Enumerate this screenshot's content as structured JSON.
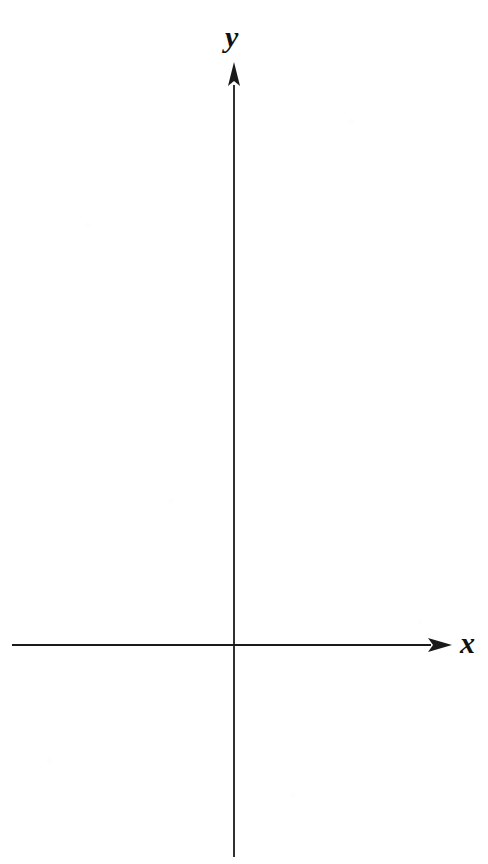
{
  "figure": {
    "width": 488,
    "height": 864,
    "background_color": "#ffffff",
    "ink_color": "#1a1a1a"
  },
  "chart_data": {
    "type": "scatter",
    "title": "",
    "subtitle": "",
    "xlabel": "x",
    "ylabel": "y",
    "x": [],
    "values": [],
    "series": [],
    "categories": [],
    "annotations": [],
    "legend": {
      "entries": [],
      "position": "none",
      "visible": false
    },
    "grid": false,
    "ticks": {
      "x_major": [],
      "y_major": [],
      "x_tick_labels": [],
      "y_tick_labels": [],
      "visible": false
    },
    "origin_label": "",
    "xlim": [
      -2.22,
      2.18
    ],
    "ylim": [
      -2.12,
      5.83
    ],
    "axis_style": {
      "spines": "centered-cross",
      "arrowheads": true,
      "line_width_px": 1.8,
      "color": "#1a1a1a"
    }
  },
  "axes": {
    "origin": {
      "x": 234,
      "y": 645
    },
    "x_axis": {
      "label": "x",
      "label_x": 460,
      "label_y": 628,
      "start_x": 12,
      "end_x": 452,
      "y": 645,
      "arrow": "right",
      "arrow_length": 24,
      "arrow_half_width": 7
    },
    "y_axis": {
      "label": "y",
      "label_x": 225,
      "label_y": 22,
      "start_y": 857,
      "end_y": 62,
      "x": 234,
      "arrow": "up",
      "arrow_length": 24,
      "arrow_half_width": 6
    }
  }
}
